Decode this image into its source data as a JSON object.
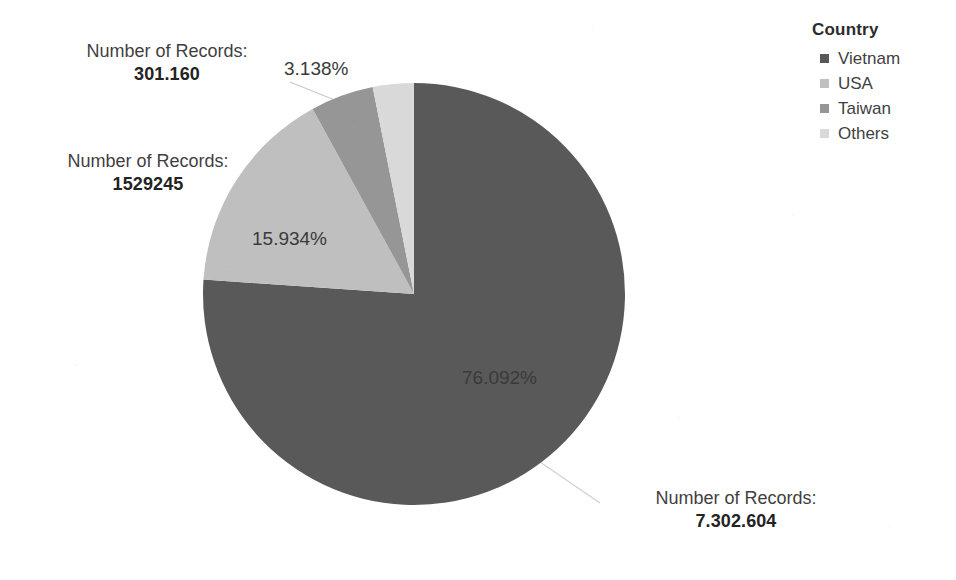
{
  "chart_data": {
    "type": "pie",
    "title": "",
    "legend_title": "Country",
    "legend_position": "top-right",
    "grid": false,
    "value_label_prefix": "Number of Records:",
    "categories": [
      "Vietnam",
      "USA",
      "Taiwan",
      "Others"
    ],
    "values": [
      7302604,
      1529245,
      301160,
      463000
    ],
    "percent_labels": [
      "76.092%",
      "15.934%",
      "4.836%",
      "3.138%"
    ],
    "percents": [
      76.092,
      15.934,
      4.836,
      3.138
    ],
    "colors": [
      "#595959",
      "#bfbfbf",
      "#969696",
      "#d9d9d9"
    ],
    "slices": [
      {
        "name": "Vietnam",
        "percent": 76.092,
        "percent_label": "76.092%",
        "color": "#595959",
        "value_label": "7.302.604"
      },
      {
        "name": "USA",
        "percent": 15.934,
        "percent_label": "15.934%",
        "color": "#bfbfbf",
        "value_label": "1529245"
      },
      {
        "name": "Taiwan",
        "percent": 4.836,
        "percent_label": "",
        "color": "#969696",
        "value_label": ""
      },
      {
        "name": "Others",
        "percent": 3.138,
        "percent_label": "3.138%",
        "color": "#d9d9d9",
        "value_label": "301.160"
      }
    ],
    "start_angle_deg": 0,
    "direction": "clockwise"
  },
  "legend": {
    "title": "Country",
    "items": [
      {
        "label": "Vietnam",
        "color": "#595959"
      },
      {
        "label": "USA",
        "color": "#bfbfbf"
      },
      {
        "label": "Taiwan",
        "color": "#969696"
      },
      {
        "label": "Others",
        "color": "#d9d9d9"
      }
    ]
  },
  "callouts": {
    "others": {
      "caption": "Number of Records:",
      "value": "301.160"
    },
    "usa": {
      "caption": "Number of Records:",
      "value": "1529245"
    },
    "vietnam": {
      "caption": "Number of Records:",
      "value": "7.302.604"
    }
  },
  "inner_labels": {
    "vietnam_pct": "76.092%",
    "usa_pct": "15.934%",
    "others_pct": "3.138%"
  }
}
